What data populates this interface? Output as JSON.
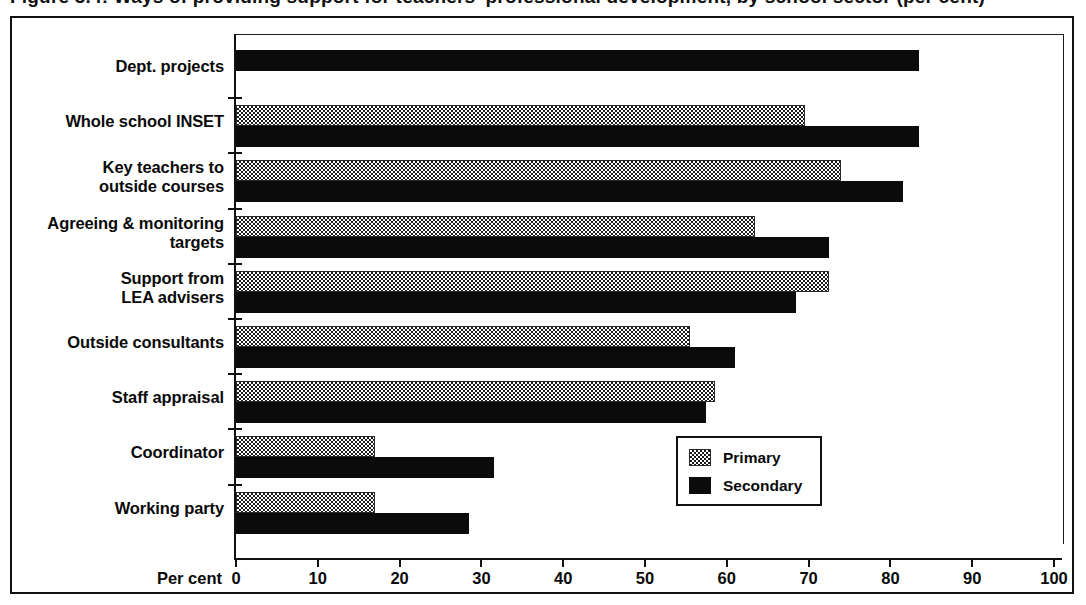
{
  "title": {
    "text": "Figure 3.4: Ways of providing support for teachers' professional development, by school sector (per cent)",
    "clipped": true
  },
  "axis": {
    "x_axis_caption": "Per cent",
    "x_ticks": [
      "0",
      "10",
      "20",
      "30",
      "40",
      "50",
      "60",
      "70",
      "80",
      "90",
      "100"
    ]
  },
  "legend": {
    "entries": [
      {
        "label": "Primary",
        "swatch": "checkered-pattern"
      },
      {
        "label": "Secondary",
        "swatch": "solid-black"
      }
    ]
  },
  "chart_data": {
    "type": "bar",
    "orientation": "horizontal",
    "title": "Ways of providing support for teachers' professional development, by school sector (per cent)",
    "xlabel": "Per cent",
    "ylabel": "",
    "xlim": [
      0,
      100
    ],
    "xticks": [
      0,
      10,
      20,
      30,
      40,
      50,
      60,
      70,
      80,
      90,
      100
    ],
    "grid": false,
    "legend_position": "bottom-right-inside",
    "categories": [
      "Dept. projects",
      "Whole school INSET",
      "Key teachers to outside courses",
      "Agreeing & monitoring targets",
      "Support from LEA advisers",
      "Outside consultants",
      "Staff appraisal",
      "Coordinator",
      "Working party"
    ],
    "series": [
      {
        "name": "Primary",
        "values": [
          null,
          69.5,
          74.0,
          63.5,
          72.5,
          55.5,
          58.5,
          17.0,
          17.0
        ]
      },
      {
        "name": "Secondary",
        "values": [
          83.5,
          83.5,
          81.5,
          72.5,
          68.5,
          61.0,
          57.5,
          31.5,
          28.5
        ]
      }
    ]
  },
  "rows": [
    {
      "label_lines": [
        "Dept. projects"
      ],
      "primary": null,
      "secondary": 83.5
    },
    {
      "label_lines": [
        "Whole school INSET"
      ],
      "primary": 69.5,
      "secondary": 83.5
    },
    {
      "label_lines": [
        "Key teachers to",
        "outside courses"
      ],
      "primary": 74.0,
      "secondary": 81.5
    },
    {
      "label_lines": [
        "Agreeing & monitoring",
        "targets"
      ],
      "primary": 63.5,
      "secondary": 72.5
    },
    {
      "label_lines": [
        "Support from",
        "LEA advisers"
      ],
      "primary": 72.5,
      "secondary": 68.5
    },
    {
      "label_lines": [
        "Outside consultants"
      ],
      "primary": 55.5,
      "secondary": 61.0
    },
    {
      "label_lines": [
        "Staff appraisal"
      ],
      "primary": 58.5,
      "secondary": 57.5
    },
    {
      "label_lines": [
        "Coordinator"
      ],
      "primary": 17.0,
      "secondary": 31.5
    },
    {
      "label_lines": [
        "Working party"
      ],
      "primary": 17.0,
      "secondary": 28.5
    }
  ]
}
